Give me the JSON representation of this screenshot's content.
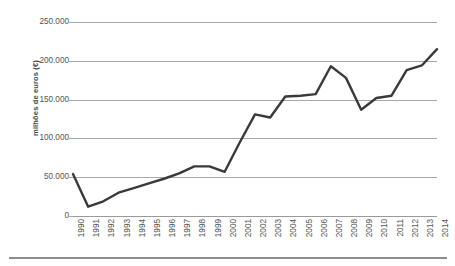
{
  "chart_data": {
    "type": "line",
    "title": "",
    "xlabel": "",
    "ylabel": "milhões de euros (€)",
    "categories": [
      "1990",
      "1991",
      "1992",
      "1993",
      "1994",
      "1995",
      "1996",
      "1997",
      "1998",
      "1999",
      "2000",
      "2001",
      "2002",
      "2003",
      "2004",
      "2005",
      "2006",
      "2007",
      "2008",
      "2009",
      "2010",
      "2011",
      "2012",
      "2013",
      "2014"
    ],
    "values": [
      54000,
      12000,
      19000,
      30000,
      36000,
      42000,
      48000,
      55000,
      64000,
      64000,
      57000,
      95000,
      131000,
      127000,
      154000,
      155000,
      157000,
      193000,
      178000,
      137000,
      152000,
      155000,
      188000,
      194000,
      215000
    ],
    "series": [
      {
        "name": "milhões de euros",
        "values": [
          54000,
          12000,
          19000,
          30000,
          36000,
          42000,
          48000,
          55000,
          64000,
          64000,
          57000,
          95000,
          131000,
          127000,
          154000,
          155000,
          157000,
          193000,
          178000,
          137000,
          152000,
          155000,
          188000,
          194000,
          215000
        ]
      }
    ],
    "ylim": [
      0,
      250000
    ],
    "yticks": [
      0,
      50000,
      100000,
      150000,
      200000,
      250000
    ],
    "ytick_labels": [
      "0",
      "50.000",
      "100.000",
      "150.000",
      "200.000",
      "250.000"
    ],
    "grid": true,
    "legend": false,
    "legend_position": "none",
    "line_color": "#3a3a3a",
    "grid_color": "#a9a9a9",
    "text_color": "#555555"
  }
}
